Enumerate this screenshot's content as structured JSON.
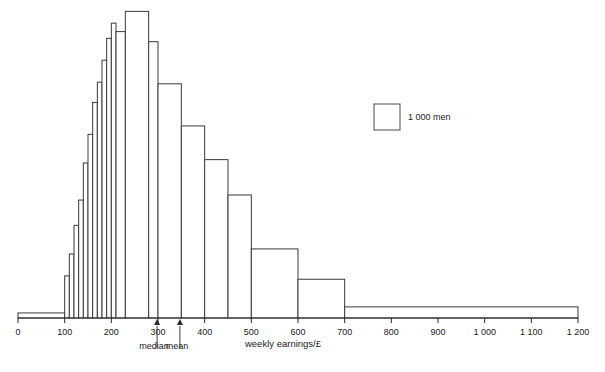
{
  "chart_data": {
    "type": "bar",
    "title": "",
    "subtitle": "",
    "xlabel": "weekly earnings/£",
    "ylabel": "",
    "xlim": [
      0,
      1200
    ],
    "ylim": [
      0,
      9200
    ],
    "grid": false,
    "legend_position": "inside-right",
    "legend": [
      {
        "label": "1 000 men",
        "swatch": "square-outline"
      }
    ],
    "x_ticks": [
      {
        "value": 0,
        "label": "0"
      },
      {
        "value": 100,
        "label": "100"
      },
      {
        "value": 200,
        "label": "200"
      },
      {
        "value": 300,
        "label": "300"
      },
      {
        "value": 400,
        "label": "400"
      },
      {
        "value": 500,
        "label": "500"
      },
      {
        "value": 600,
        "label": "600"
      },
      {
        "value": 700,
        "label": "700"
      },
      {
        "value": 800,
        "label": "800"
      },
      {
        "value": 900,
        "label": "900"
      },
      {
        "value": 1000,
        "label": "1 000"
      },
      {
        "value": 1100,
        "label": "1 100"
      },
      {
        "value": 1200,
        "label": "1 200"
      }
    ],
    "bins": [
      {
        "x0": 0,
        "x1": 100,
        "count": 150
      },
      {
        "x0": 100,
        "x1": 110,
        "count": 1250
      },
      {
        "x0": 110,
        "x1": 120,
        "count": 1900
      },
      {
        "x0": 120,
        "x1": 130,
        "count": 2750
      },
      {
        "x0": 130,
        "x1": 140,
        "count": 3500
      },
      {
        "x0": 140,
        "x1": 150,
        "count": 4600
      },
      {
        "x0": 150,
        "x1": 160,
        "count": 5450
      },
      {
        "x0": 160,
        "x1": 170,
        "count": 6400
      },
      {
        "x0": 170,
        "x1": 180,
        "count": 7000
      },
      {
        "x0": 180,
        "x1": 190,
        "count": 7650
      },
      {
        "x0": 190,
        "x1": 200,
        "count": 8300
      },
      {
        "x0": 200,
        "x1": 210,
        "count": 8750
      },
      {
        "x0": 210,
        "x1": 230,
        "count": 8500
      },
      {
        "x0": 230,
        "x1": 280,
        "count": 9100
      },
      {
        "x0": 280,
        "x1": 300,
        "count": 8200
      },
      {
        "x0": 300,
        "x1": 350,
        "count": 6950
      },
      {
        "x0": 350,
        "x1": 400,
        "count": 5700
      },
      {
        "x0": 400,
        "x1": 450,
        "count": 4700
      },
      {
        "x0": 450,
        "x1": 500,
        "count": 3650
      },
      {
        "x0": 500,
        "x1": 600,
        "count": 2050
      },
      {
        "x0": 600,
        "x1": 700,
        "count": 1150
      },
      {
        "x0": 700,
        "x1": 1200,
        "count": 330
      }
    ],
    "annotations": [
      {
        "name": "median",
        "label": "median",
        "value": 298
      },
      {
        "name": "mean",
        "label": "mean",
        "value": 347
      }
    ],
    "colors": {
      "bar_fill": "#ffffff",
      "bar_stroke": "#3a3a3a",
      "axis": "#2b2b2b",
      "text": "#1a1a1a"
    }
  }
}
